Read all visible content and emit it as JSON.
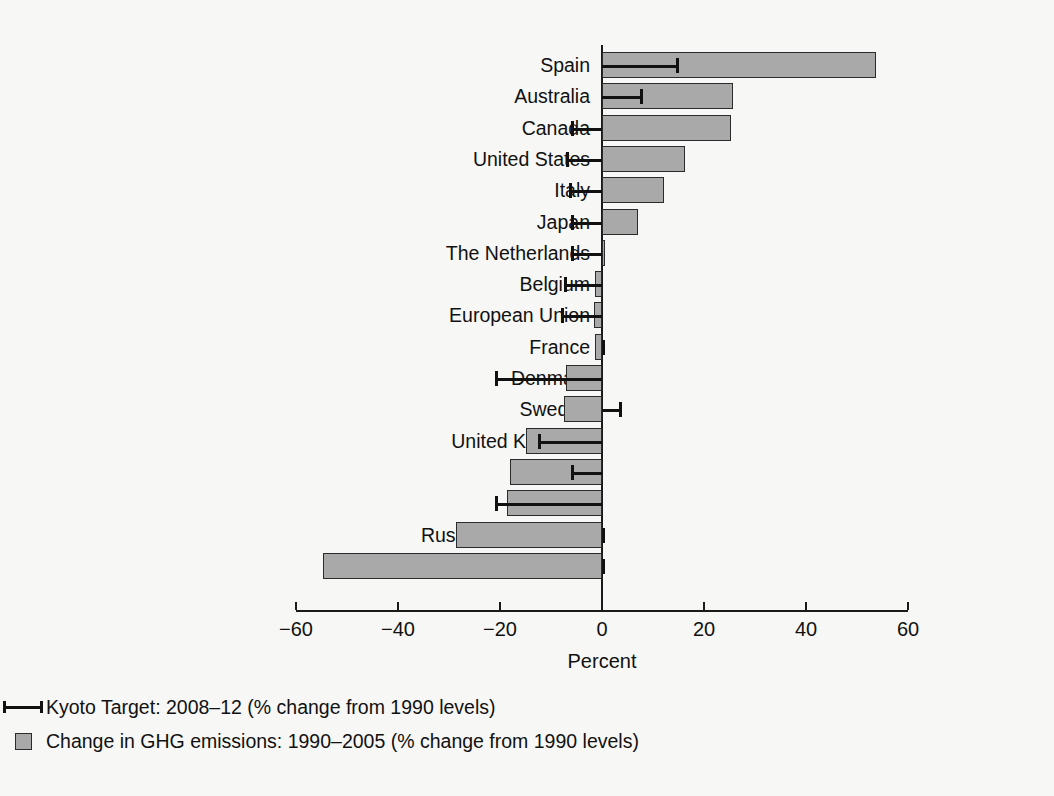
{
  "chart_data": {
    "type": "bar",
    "orientation": "horizontal",
    "title": "",
    "xlabel": "Percent",
    "ylabel": "",
    "xlim": [
      -60,
      60
    ],
    "xticks": [
      -60,
      -40,
      -20,
      0,
      20,
      40,
      60
    ],
    "xtick_labels": [
      "−60",
      "−40",
      "−20",
      "0",
      "20",
      "40",
      "60"
    ],
    "grid": false,
    "legend_position": "bottom",
    "categories": [
      "Spain",
      "Australia",
      "Canada",
      "United States",
      "Italy",
      "Japan",
      "The Netherlands",
      "Belgium",
      "European Union",
      "France",
      "Denmark",
      "Sweden",
      "United Kingdom",
      "Poland",
      "Germany",
      "Russian Federation",
      "Ukraine"
    ],
    "series": [
      {
        "name": "Change in GHG emissions: 1990–2005 (% change from 1990 levels)",
        "marker": "bar",
        "color": "#a9a9a9",
        "values": [
          53.8,
          25.6,
          25.3,
          16.3,
          12.1,
          7.0,
          0.0,
          -1.4,
          -1.5,
          -1.3,
          -7.0,
          -7.4,
          -15.0,
          -18.0,
          -18.7,
          -28.7,
          -54.7
        ]
      },
      {
        "name": "Kyoto Target: 2008–12 (% change from 1990 levels)",
        "marker": "range-line",
        "color": "#111111",
        "values": [
          15.0,
          8.0,
          -6.0,
          -7.0,
          -6.5,
          -6.0,
          -6.0,
          -7.5,
          -8.0,
          0.0,
          -21.0,
          4.0,
          -12.5,
          -6.0,
          -21.0,
          0.0,
          0.0
        ]
      }
    ],
    "legend": [
      {
        "marker": "range-line",
        "label": "Kyoto Target: 2008–12 (% change from 1990 levels)"
      },
      {
        "marker": "square",
        "label": "Change in GHG emissions: 1990–2005 (% change from 1990 levels)"
      }
    ]
  },
  "colors": {
    "background": "#f7f7f5",
    "bar_fill": "#a9a9a9",
    "bar_stroke": "#2b2b2b",
    "axis": "#1a1a1a",
    "text": "#111111"
  }
}
